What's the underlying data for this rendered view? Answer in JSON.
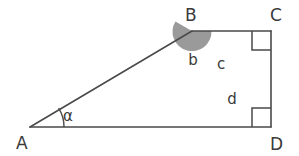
{
  "figure": {
    "stroke_color": "#4a4a4a",
    "shade_color": "#9a9a9a",
    "background_color": "#ffffff",
    "stroke_width": 1.6
  },
  "vertices": [
    {
      "id": "A",
      "label": "A",
      "x": 30,
      "y": 127,
      "label_x": 16,
      "label_y": 149
    },
    {
      "id": "B",
      "label": "B",
      "x": 192,
      "y": 31,
      "label_x": 185,
      "label_y": 21
    },
    {
      "id": "C",
      "label": "C",
      "x": 271,
      "y": 31,
      "label_x": 270,
      "label_y": 21
    },
    {
      "id": "D",
      "label": "D",
      "x": 271,
      "y": 127,
      "label_x": 270,
      "label_y": 150
    }
  ],
  "segments": [
    {
      "id": "AB",
      "from": "A",
      "to": "B",
      "label": ""
    },
    {
      "id": "BC",
      "from": "B",
      "to": "C",
      "label": "c",
      "label_x": 221,
      "label_y": 69
    },
    {
      "id": "CD",
      "from": "C",
      "to": "D",
      "label": "d",
      "label_x": 232,
      "label_y": 104
    },
    {
      "id": "AD",
      "from": "A",
      "to": "D",
      "label": ""
    }
  ],
  "angles": [
    {
      "id": "alpha-at-A",
      "vertex": "A",
      "label": "α",
      "label_x": 68,
      "label_y": 121,
      "marker": "arc",
      "shaded": false
    },
    {
      "id": "b-at-B",
      "vertex": "B",
      "label": "b",
      "label_x": 193,
      "label_y": 65,
      "marker": "filled-wedge",
      "shaded": true
    }
  ],
  "right_angle_marks": [
    {
      "id": "right-angle-C",
      "vertex": "C",
      "opens": "down-left"
    },
    {
      "id": "right-angle-D",
      "vertex": "D",
      "opens": "up-left"
    }
  ]
}
